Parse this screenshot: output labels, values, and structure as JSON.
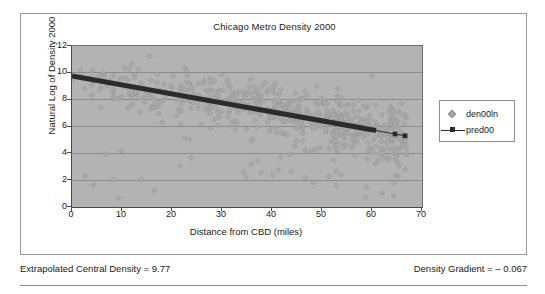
{
  "chart_data": {
    "type": "scatter",
    "title": "Chicago Metro Density 2000",
    "xlabel": "Distance from CBD (miles)",
    "ylabel": "Natural Log of Density 2000",
    "xlim": [
      0,
      70
    ],
    "ylim": [
      0,
      12
    ],
    "xticks": [
      0,
      10,
      20,
      30,
      40,
      50,
      60,
      70
    ],
    "yticks": [
      0,
      2,
      4,
      6,
      8,
      10,
      12
    ],
    "grid": "horizontal",
    "legend_position": "right",
    "colors": {
      "plot_background": "#b3b3b3",
      "gridline": "#8b8b8b",
      "axis": "#4a4a4a",
      "scatter_marker": "#a9a9a9",
      "trend_line": "#2b2b2b",
      "frame": "#9a9a9a",
      "text": "#1a1a1a"
    },
    "series": [
      {
        "name": "den00ln",
        "type": "scatter",
        "marker": "diamond",
        "color": "#a9a9a9",
        "n_points": 620,
        "description": "Observed natural log of census-tract density vs distance from the Chicago CBD; dense cloud from x=0 to x=67, thinning with distance."
      },
      {
        "name": "pred00",
        "type": "line",
        "marker": "square",
        "color": "#2b2b2b",
        "intercept": 9.77,
        "slope": -0.067,
        "x_start": 0,
        "x_end": 67,
        "y_start": 9.77,
        "y_end": 5.28,
        "description": "Fitted negative exponential density gradient line."
      }
    ]
  },
  "legend": {
    "items": [
      {
        "label": "den00ln",
        "key": "diamond-marker"
      },
      {
        "label": "pred00",
        "key": "line-square-marker"
      }
    ]
  },
  "footer": {
    "left": "Extrapolated Central Density = 9.77",
    "right": "Density Gradient = – 0.067"
  }
}
